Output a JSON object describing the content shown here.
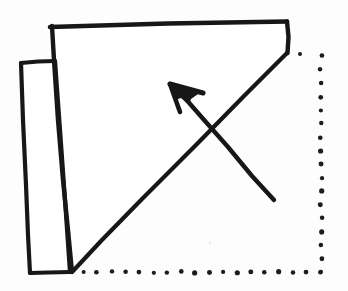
{
  "figure": {
    "canvas": {
      "width": 348,
      "height": 291
    },
    "background_color": "#fdfdfd",
    "ink_color": "#171717",
    "paper_fill": "#ffffff"
  },
  "geometry": {
    "main_sheet": {
      "name": "main-sheet-outline",
      "stroke_width": 4.2,
      "points": "52,26 287,22 287,53 72,272",
      "fill_points": "52,26 287,22 287,53 72,272 55,61"
    },
    "top_edge": {
      "name": "top-edge",
      "stroke_width": 4.6,
      "points": "50,27 168,23.5 287,21.5"
    },
    "right_short_edge": {
      "name": "right-short-edge",
      "stroke_width": 4.4,
      "points": "287,21.5 288.5,37 287.5,53"
    },
    "diagonal_fold": {
      "name": "diagonal-fold-line",
      "stroke_width": 4.2,
      "points": "287,53 244,96 196,145 142,199 101,241 73,271"
    },
    "main_left_edge": {
      "name": "main-left-edge",
      "stroke_width": 4.4,
      "points": "52,26 54,60 58,120 63,180 68,230 72,272"
    },
    "flap": {
      "name": "left-flap-outline",
      "stroke_width": 4.2,
      "fill_points": "21,63 55,61 70,272 30,273",
      "top_edge": "21,63 38,61.5 55,61",
      "left_edge": "21,63 23,120 26,185 28,235 30,273",
      "bottom_edge": "30,273 48,272.5 70,272",
      "right_edge": "55,61 60,130 65,200 70,272"
    },
    "arrow": {
      "name": "fold-direction-arrow",
      "stroke_width": 4.4,
      "shaft": "274,200 252,176 228,147 205,121 184,97",
      "tip": [
        170,
        84
      ],
      "head_points": "170,84 201,92 191,99 189,105 181,98 175,100",
      "head_barb1": "170,84 203,93",
      "head_barb2": "170,84 180,112"
    },
    "dotted_right_edge": {
      "name": "dotted-right-edge",
      "dot_radius": 2.3,
      "x": 321,
      "y_start": 56,
      "y_end": 272,
      "count": 17
    },
    "dotted_bottom_edge": {
      "name": "dotted-bottom-edge",
      "dot_radius": 2.3,
      "y": 272,
      "x_start": 83,
      "x_end": 321,
      "count": 18
    },
    "stray_dot": {
      "name": "stray-dot-mark",
      "cx": 300,
      "cy": 54,
      "r": 2.0
    },
    "scan_specks": [
      {
        "cx": 140,
        "cy": 140,
        "r": 1.4
      },
      {
        "cx": 146,
        "cy": 145,
        "r": 1.0
      },
      {
        "cx": 248,
        "cy": 62,
        "r": 0.9
      },
      {
        "cx": 92,
        "cy": 200,
        "r": 0.8
      },
      {
        "cx": 210,
        "cy": 243,
        "r": 0.9
      },
      {
        "cx": 120,
        "cy": 88,
        "r": 0.8
      }
    ]
  },
  "chart_data": {
    "type": "diagram",
    "elements": [
      {
        "label": "Main sheet quadrilateral",
        "kind": "solid-outline"
      },
      {
        "label": "Narrow left flap",
        "kind": "solid-outline"
      },
      {
        "label": "Diagonal valley fold line",
        "kind": "solid-line"
      },
      {
        "label": "Hidden right edge",
        "kind": "dotted-line"
      },
      {
        "label": "Hidden bottom edge",
        "kind": "dotted-line"
      },
      {
        "label": "Fold direction arrow",
        "kind": "arrow"
      }
    ]
  }
}
